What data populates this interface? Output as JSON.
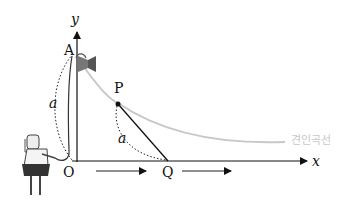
{
  "diagram": {
    "axes": {
      "x_label": "x",
      "y_label": "y",
      "origin_label": "O"
    },
    "points": {
      "A": "A",
      "P": "P",
      "Q": "Q"
    },
    "segment_labels": {
      "OA_length": "a",
      "PQ_length": "a"
    },
    "curve_label": "견인곡선",
    "colors": {
      "axis": "#111111",
      "curve": "#c8c8c8",
      "tangent": "#111111",
      "dotted_arc": "#222222"
    }
  }
}
